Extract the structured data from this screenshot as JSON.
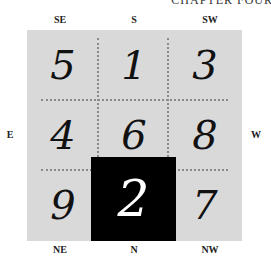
{
  "header": {
    "title": "CHAPTER FOUR"
  },
  "directions": {
    "top": [
      "SE",
      "S",
      "SW"
    ],
    "bottom": [
      "NE",
      "N",
      "NW"
    ],
    "left": "E",
    "right": "W"
  },
  "grid": {
    "rows": [
      [
        "5",
        "1",
        "3"
      ],
      [
        "4",
        "6",
        "8"
      ],
      [
        "9",
        "2",
        "7"
      ]
    ],
    "highlighted_cell": {
      "row": 2,
      "col": 1,
      "value": "2"
    },
    "colors": {
      "background": "#d9d9d9",
      "highlight": "#000000",
      "highlight_text": "#ffffff",
      "dots": "#8a8a8a"
    }
  }
}
